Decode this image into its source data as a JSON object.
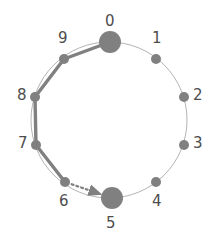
{
  "figure": {
    "type": "cycle-graph-diagram",
    "background_color": "#ffffff"
  },
  "style": {
    "circle_stroke": "#b3b3b3",
    "circle_stroke_width": 1,
    "node_color": "#808080",
    "highlight_color": "#808080",
    "highlight_edge_width": 3.4,
    "dashed_edge_color": "#808080",
    "label_color": "#4d4d4d",
    "label_font_size": 15,
    "small_node_radius": 5,
    "large_node_radius": 11
  },
  "layout": {
    "center_x": 109,
    "center_y": 120,
    "radius": 78
  },
  "nodes": [
    {
      "id": "0",
      "label": "0",
      "x": 110,
      "y": 42,
      "radius": 11,
      "emphasis": "large",
      "label_x": 105,
      "label_y": 14
    },
    {
      "id": "1",
      "label": "1",
      "x": 156,
      "y": 59,
      "radius": 5,
      "emphasis": "small",
      "label_x": 152,
      "label_y": 31
    },
    {
      "id": "2",
      "label": "2",
      "x": 184,
      "y": 97,
      "radius": 5,
      "emphasis": "small",
      "label_x": 193,
      "label_y": 88
    },
    {
      "id": "3",
      "label": "3",
      "x": 184,
      "y": 145,
      "radius": 5,
      "emphasis": "small",
      "label_x": 193,
      "label_y": 136
    },
    {
      "id": "4",
      "label": "4",
      "x": 156,
      "y": 182,
      "radius": 5,
      "emphasis": "small",
      "label_x": 152,
      "label_y": 194
    },
    {
      "id": "5",
      "label": "5",
      "x": 112,
      "y": 198,
      "radius": 11,
      "emphasis": "large",
      "label_x": 106,
      "label_y": 216
    },
    {
      "id": "6",
      "label": "6",
      "x": 65,
      "y": 182,
      "radius": 5,
      "emphasis": "small",
      "label_x": 59,
      "label_y": 194
    },
    {
      "id": "7",
      "label": "7",
      "x": 36,
      "y": 145,
      "radius": 5,
      "emphasis": "small",
      "label_x": 18,
      "label_y": 136
    },
    {
      "id": "8",
      "label": "8",
      "x": 35,
      "y": 97,
      "radius": 5,
      "emphasis": "small",
      "label_x": 17,
      "label_y": 88
    },
    {
      "id": "9",
      "label": "9",
      "x": 64,
      "y": 59,
      "radius": 5,
      "emphasis": "small",
      "label_x": 58,
      "label_y": 31
    }
  ],
  "edges": {
    "highlighted_path": [
      {
        "from": "0",
        "to": "9"
      },
      {
        "from": "9",
        "to": "8"
      },
      {
        "from": "8",
        "to": "7"
      },
      {
        "from": "7",
        "to": "6"
      }
    ],
    "dashed_arrow": {
      "from": "6",
      "to": "5",
      "dash_pattern": "2,3",
      "arrowhead": true
    }
  }
}
